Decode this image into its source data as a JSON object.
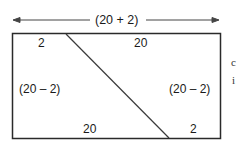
{
  "diagram": {
    "top_dimension": "(20 + 2)",
    "labels": {
      "top_left": "2",
      "top_right": "20",
      "left_middle": "(20 – 2)",
      "right_middle": "(20 – 2)",
      "bottom_left": "20",
      "bottom_right": "2"
    },
    "side_text": [
      "c",
      "i"
    ],
    "colors": {
      "stroke": "#2a2a2a",
      "background": "#ffffff"
    }
  }
}
